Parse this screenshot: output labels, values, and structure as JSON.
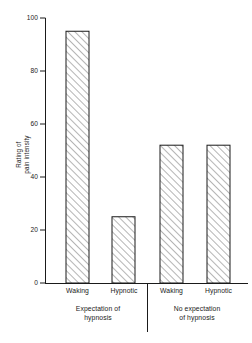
{
  "chart_data": {
    "type": "bar",
    "title": "",
    "subtitle": "",
    "xlabel": "",
    "ylabel": "Rating of pain intensity",
    "ylabel_lines": [
      "Rating of",
      "pain intensity"
    ],
    "ylim": [
      0,
      100
    ],
    "yticks": [
      0,
      20,
      40,
      60,
      80,
      100
    ],
    "ytick_labels": [
      "0",
      "20",
      "40",
      "60",
      "80",
      "100"
    ],
    "grid": false,
    "legend": null,
    "categories": [
      "Waking",
      "Hypnotic",
      "Waking",
      "Hypnotic"
    ],
    "values": [
      95,
      25,
      52,
      52
    ],
    "bar_style": {
      "fill": "#ffffff",
      "edge": "#1a1a1a",
      "hatch": "diagonal-45"
    },
    "groups": [
      {
        "label_lines": [
          "Expectation of",
          "hypnosis"
        ],
        "label": "Expectation of hypnosis",
        "bars": [
          {
            "category": "Waking",
            "value": 95
          },
          {
            "category": "Hypnotic",
            "value": 25
          }
        ]
      },
      {
        "label_lines": [
          "No expectation",
          "of hypnosis"
        ],
        "label": "No expectation of hypnosis",
        "bars": [
          {
            "category": "Waking",
            "value": 52
          },
          {
            "category": "Hypnotic",
            "value": 52
          }
        ]
      }
    ],
    "group_divider": true,
    "colors": {
      "axis": "#1a1a1a",
      "bar_edge": "#1a1a1a",
      "bar_fill": "#ffffff",
      "hatch": "#2b2b2b",
      "background": "#ffffff"
    }
  }
}
